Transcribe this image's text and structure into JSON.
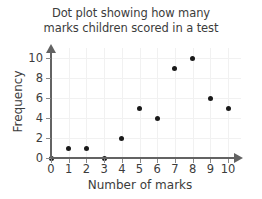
{
  "chart_data": {
    "type": "scatter",
    "title": "Dot plot showing how many marks children scored in a test",
    "title_lines": [
      "Dot plot showing how many",
      "marks children scored in a test"
    ],
    "xlabel": "Number of marks",
    "ylabel": "Frequency",
    "x": [
      0,
      1,
      2,
      3,
      4,
      5,
      6,
      7,
      8,
      9,
      10
    ],
    "values": [
      0,
      1,
      1,
      0,
      2,
      5,
      4,
      9,
      10,
      6,
      5
    ],
    "points": [
      {
        "x": 0,
        "y": 0
      },
      {
        "x": 1,
        "y": 1
      },
      {
        "x": 2,
        "y": 1
      },
      {
        "x": 3,
        "y": 0
      },
      {
        "x": 4,
        "y": 2
      },
      {
        "x": 5,
        "y": 5
      },
      {
        "x": 6,
        "y": 4
      },
      {
        "x": 7,
        "y": 9
      },
      {
        "x": 8,
        "y": 10
      },
      {
        "x": 9,
        "y": 6
      },
      {
        "x": 10,
        "y": 5
      }
    ],
    "xlim": [
      0,
      10
    ],
    "ylim": [
      0,
      10
    ],
    "xticks": [
      "0",
      "1",
      "2",
      "3",
      "4",
      "5",
      "6",
      "7",
      "8",
      "9",
      "10"
    ],
    "yticks": [
      "0",
      "2",
      "4",
      "6",
      "8",
      "10"
    ],
    "xtick_values": [
      0,
      1,
      2,
      3,
      4,
      5,
      6,
      7,
      8,
      9,
      10
    ],
    "ytick_values": [
      0,
      2,
      4,
      6,
      8,
      10
    ],
    "grid": true,
    "legend": null,
    "marker_color": "#1a1a1a",
    "axis_color": "#636363",
    "grid_color": "#f1f1f1",
    "text_color": "#3c3c3c",
    "background_color": "#ffffff"
  }
}
